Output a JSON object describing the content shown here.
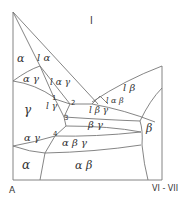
{
  "diagram": {
    "type": "ternary-phase-diagram-section",
    "axis": {
      "left_label": "A",
      "right_label": "VI - VII"
    },
    "regions": {
      "l": "l",
      "alpha_top": "α",
      "l_alpha": "l α",
      "alpha_gamma_upper": "α γ",
      "l_alpha_gamma": "l α γ",
      "gamma": "γ",
      "l_gamma": "l γ",
      "l_beta": "l β",
      "l_alpha_beta": "l α β",
      "l_beta_gamma": "l β γ",
      "beta_gamma": "β γ",
      "beta": "β",
      "alpha_gamma_lower": "α γ",
      "alpha_beta_gamma": "α β γ",
      "alpha_bottom": "α",
      "alpha_beta": "α β"
    },
    "points": [
      "1",
      "2",
      "3",
      "4"
    ]
  }
}
